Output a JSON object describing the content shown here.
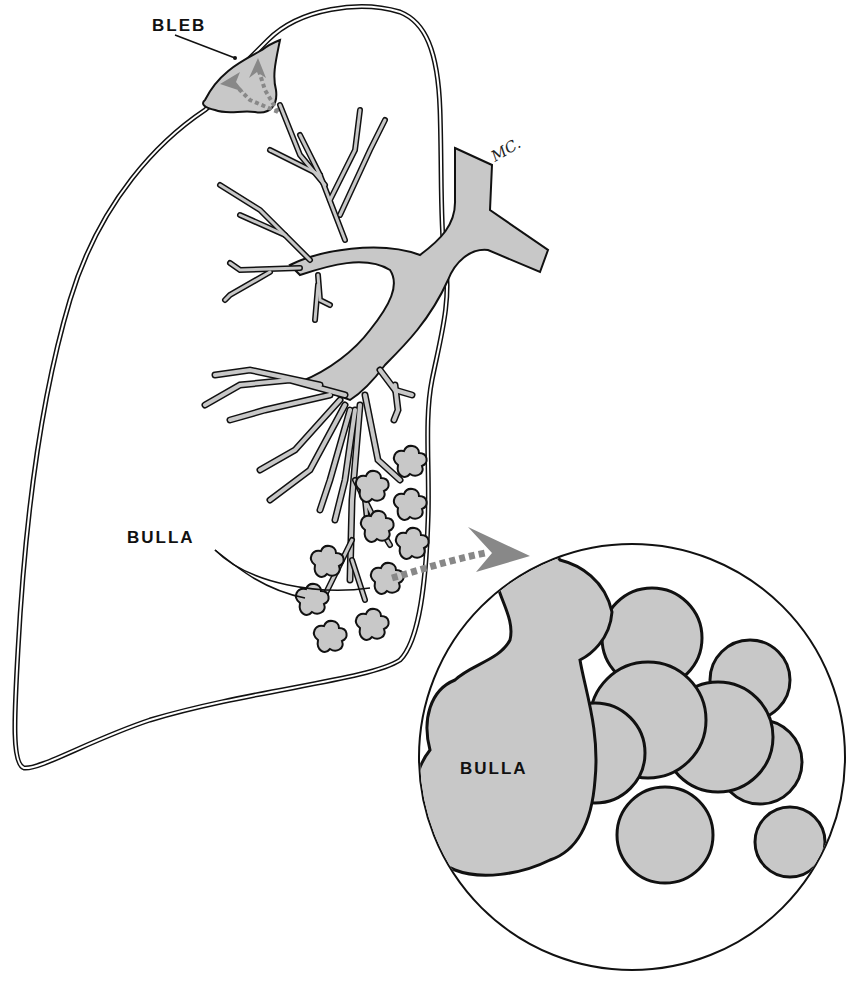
{
  "diagram": {
    "labels": {
      "bleb": "BLEB",
      "bulla_small": "BULLA",
      "bulla_magnified": "BULLA"
    },
    "signature": "MC.",
    "colors": {
      "tissue_fill": "#c8c8c8",
      "outline": "#111111",
      "arrow": "#888888",
      "background": "#ffffff"
    },
    "components": [
      "lung-outline (visceral pleura, double line)",
      "bleb at apex with dotted arrows showing air leak into pleural layer",
      "bronchial tree branching from main bronchus",
      "alveolar clusters at distal bronchioles",
      "small bulla with dotted arrow to magnified view",
      "magnified circular inset of bulla"
    ]
  }
}
